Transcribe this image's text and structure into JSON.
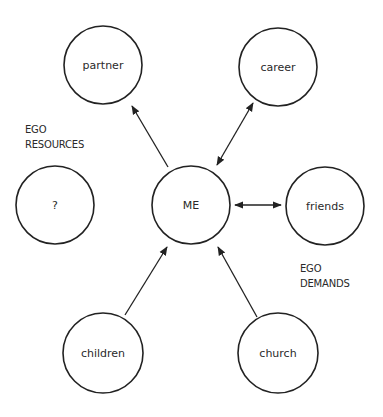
{
  "diagram": {
    "type": "ego-network",
    "center": {
      "id": "me",
      "label": "ME",
      "x": 191,
      "y": 205,
      "r": 39
    },
    "nodes": [
      {
        "id": "partner",
        "label": "partner",
        "x": 103,
        "y": 65,
        "r": 39
      },
      {
        "id": "career",
        "label": "career",
        "x": 278,
        "y": 67,
        "r": 39
      },
      {
        "id": "unknown",
        "label": "?",
        "x": 55,
        "y": 205,
        "r": 39
      },
      {
        "id": "friends",
        "label": "friends",
        "x": 325,
        "y": 206,
        "r": 39
      },
      {
        "id": "children",
        "label": "children",
        "x": 103,
        "y": 353,
        "r": 40
      },
      {
        "id": "church",
        "label": "church",
        "x": 278,
        "y": 353,
        "r": 40
      }
    ],
    "edges": [
      {
        "id": "me-partner",
        "from": "me",
        "to": "partner",
        "direction": "to",
        "x1": 168,
        "y1": 167,
        "x2": 132,
        "y2": 106
      },
      {
        "id": "me-career",
        "from": "me",
        "to": "career",
        "direction": "both",
        "x1": 217,
        "y1": 165,
        "x2": 253,
        "y2": 103
      },
      {
        "id": "me-friends",
        "from": "me",
        "to": "friends",
        "direction": "both",
        "x1": 235,
        "y1": 205,
        "x2": 281,
        "y2": 205
      },
      {
        "id": "children-me",
        "from": "children",
        "to": "me",
        "direction": "to",
        "x1": 125,
        "y1": 315,
        "x2": 167,
        "y2": 247
      },
      {
        "id": "church-me",
        "from": "church",
        "to": "me",
        "direction": "to",
        "x1": 257,
        "y1": 317,
        "x2": 218,
        "y2": 247
      }
    ],
    "group_labels": [
      {
        "id": "ego-resources",
        "lines": [
          "EGO",
          "RESOURCES"
        ],
        "x": 25,
        "y": 133
      },
      {
        "id": "ego-demands",
        "lines": [
          "EGO",
          "DEMANDS"
        ],
        "x": 300,
        "y": 272
      }
    ],
    "colors": {
      "stroke": "#222222",
      "text": "#2a2a2a",
      "background": "#ffffff"
    }
  }
}
